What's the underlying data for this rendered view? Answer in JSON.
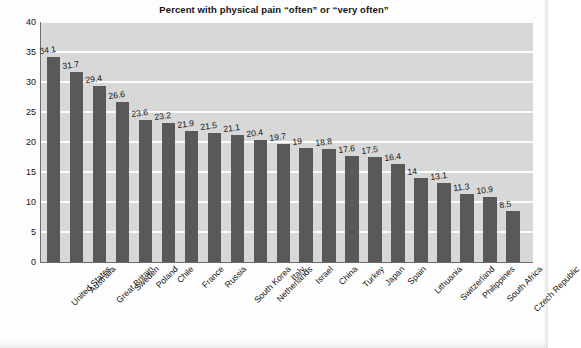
{
  "chart_data": {
    "type": "bar",
    "title": "Percent with physical pain “often” or “very often”",
    "xlabel": "",
    "ylabel": "Percentage",
    "ylim": [
      0,
      40
    ],
    "yticks": [
      0,
      5,
      10,
      15,
      20,
      25,
      30,
      35,
      40
    ],
    "ytick_labels": [
      "0",
      "5",
      "10",
      "15",
      "20",
      "25",
      "30",
      "35",
      "40"
    ],
    "grid": "horizontal",
    "legend": "none",
    "bar_color": "#595959",
    "plot_background": "#d8d8d8",
    "gridline_color": "#fbfbfb",
    "categories": [
      "United States",
      "Australia",
      "Great Britain",
      "Sweden",
      "Poland",
      "Chile",
      "France",
      "Russia",
      "South Korea",
      "Netherlands",
      "Italy",
      "Israel",
      "China",
      "Turkey",
      "Japan",
      "Spain",
      "Lithuania",
      "Switzerland",
      "Philippines",
      "South Africa",
      "Czech Republic"
    ],
    "values": [
      34.1,
      31.7,
      29.4,
      26.6,
      23.6,
      23.2,
      21.9,
      21.5,
      21.1,
      20.4,
      19.7,
      19,
      18.8,
      17.6,
      17.5,
      16.4,
      14,
      13.1,
      11.3,
      10.9,
      8.5
    ],
    "value_labels": [
      "34.1",
      "31.7",
      "29.4",
      "26.6",
      "23.6",
      "23.2",
      "21.9",
      "21.5",
      "21.1",
      "20.4",
      "19.7",
      "19",
      "18.8",
      "17.6",
      "17.5",
      "16.4",
      "14",
      "13.1",
      "11.3",
      "10.9",
      "8.5"
    ]
  },
  "caption": {
    "text": ""
  }
}
